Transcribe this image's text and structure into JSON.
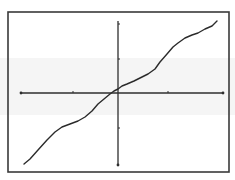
{
  "chart_data": {
    "type": "line",
    "title": "",
    "xlabel": "",
    "ylabel": "",
    "grid": false,
    "legend": null,
    "xlim": [
      -2,
      2
    ],
    "ylim": [
      -2,
      2
    ],
    "x_ticks": [
      -2,
      -1,
      0,
      1,
      2
    ],
    "y_ticks": [
      -2,
      -1,
      0,
      1,
      2
    ],
    "x_tick_labels": [],
    "y_tick_labels": [],
    "series": [
      {
        "name": "curve",
        "x": [
          -1.85,
          -1.73,
          -1.56,
          -1.38,
          -1.22,
          -1.08,
          -0.92,
          -0.76,
          -0.62,
          -0.49,
          -0.37,
          -0.24,
          -0.12,
          -0.05,
          0.0,
          0.08,
          0.18,
          0.32,
          0.44,
          0.6,
          0.74,
          0.84,
          0.98,
          1.1,
          1.2,
          1.34,
          1.48,
          1.6,
          1.74,
          1.88,
          1.98
        ],
        "y": [
          -1.99,
          -1.83,
          -1.58,
          -1.3,
          -1.07,
          -0.93,
          -0.85,
          -0.77,
          -0.66,
          -0.49,
          -0.3,
          -0.17,
          -0.03,
          0.06,
          0.11,
          0.19,
          0.25,
          0.33,
          0.42,
          0.53,
          0.67,
          0.87,
          1.09,
          1.29,
          1.4,
          1.54,
          1.63,
          1.69,
          1.8,
          1.89,
          2.03
        ]
      }
    ]
  },
  "frame": {
    "left": 8,
    "top": 12,
    "right": 229,
    "bottom": 172,
    "stroke": "#3a3a3a"
  },
  "axes": {
    "x_axis_y": 93,
    "x_axis_from": 21,
    "x_axis_to": 223,
    "y_axis_x": 118,
    "y_axis_from": 21,
    "y_axis_to": 165,
    "x_tick_positions": [
      21,
      73,
      168,
      223
    ],
    "y_tick_positions": [
      24,
      59,
      128,
      165
    ],
    "stroke": "#2e2e2e"
  },
  "curve_pixels": [
    [
      24,
      164
    ],
    [
      30,
      159
    ],
    [
      38,
      150
    ],
    [
      47,
      140
    ],
    [
      55,
      132
    ],
    [
      62,
      127
    ],
    [
      70,
      124
    ],
    [
      78,
      121
    ],
    [
      85,
      117
    ],
    [
      92,
      111
    ],
    [
      98,
      104
    ],
    [
      104,
      99
    ],
    [
      110,
      94
    ],
    [
      114,
      91
    ],
    [
      118,
      89
    ],
    [
      122,
      86
    ],
    [
      127,
      84
    ],
    [
      134,
      81
    ],
    [
      140,
      78
    ],
    [
      148,
      74
    ],
    [
      155,
      69
    ],
    [
      160,
      62
    ],
    [
      167,
      54
    ],
    [
      173,
      47
    ],
    [
      178,
      43
    ],
    [
      185,
      38
    ],
    [
      192,
      35
    ],
    [
      198,
      33
    ],
    [
      205,
      29
    ],
    [
      212,
      26
    ],
    [
      217,
      21
    ]
  ],
  "colors": {
    "background": "#ffffff",
    "line": "#2b2b2b",
    "scan_band": "#ececec"
  }
}
